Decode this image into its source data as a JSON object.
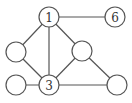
{
  "diagram": {
    "type": "graph",
    "colors": {
      "stroke": "#555555",
      "fill": "#ffffff",
      "text": "#333333"
    },
    "nodes": [
      {
        "id": "n1",
        "label": "1",
        "x": 49,
        "y": 17
      },
      {
        "id": "n6",
        "label": "6",
        "x": 115,
        "y": 17
      },
      {
        "id": "nLM",
        "label": "",
        "x": 16,
        "y": 52
      },
      {
        "id": "nRM",
        "label": "",
        "x": 82,
        "y": 51
      },
      {
        "id": "nBL",
        "label": "",
        "x": 16,
        "y": 85
      },
      {
        "id": "n3",
        "label": "3",
        "x": 49,
        "y": 85
      },
      {
        "id": "nBR",
        "label": "",
        "x": 117,
        "y": 85
      }
    ],
    "edges": [
      [
        "n1",
        "n6"
      ],
      [
        "n1",
        "nLM"
      ],
      [
        "n1",
        "n3"
      ],
      [
        "n1",
        "nRM"
      ],
      [
        "nLM",
        "n3"
      ],
      [
        "nRM",
        "n3"
      ],
      [
        "nRM",
        "nBR"
      ],
      [
        "nBL",
        "n3"
      ],
      [
        "n3",
        "nBR"
      ]
    ],
    "radius": 10
  }
}
